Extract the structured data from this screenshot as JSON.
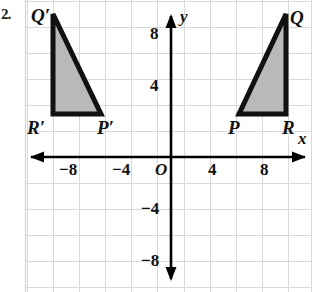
{
  "question_number": "2.",
  "figure": {
    "type": "coordinate-plane-with-triangles",
    "background_color": "#ffffff",
    "grid_color": "#d8d8d8",
    "axis_color": "#000000",
    "shape_fill_color": "#b8b8b8",
    "shape_stroke_color": "#000000",
    "axes": {
      "x_label": "x",
      "y_label": "y",
      "origin_label": "O",
      "x_ticks": [
        "−8",
        "−4",
        "4",
        "8"
      ],
      "y_ticks": [
        "8",
        "4",
        "−4",
        "−8"
      ],
      "x_range": [
        -10,
        10
      ],
      "y_range": [
        -10,
        11
      ],
      "grid_step": 2,
      "arrows": "both-ends-on-both-axes"
    },
    "shapes": [
      {
        "name": "triangle-image",
        "vertices": [
          {
            "label": "Q′",
            "x": -9,
            "y": 11
          },
          {
            "label": "P′",
            "x": -5.5,
            "y": 3.5
          },
          {
            "label": "R′",
            "x": -9,
            "y": 3.5
          }
        ]
      },
      {
        "name": "triangle-preimage",
        "vertices": [
          {
            "label": "Q",
            "x": 8.8,
            "y": 11
          },
          {
            "label": "P",
            "x": 5.3,
            "y": 3.5
          },
          {
            "label": "R",
            "x": 8.8,
            "y": 3.5
          }
        ]
      }
    ],
    "vertex_labels": {
      "q_prime": "Q′",
      "r_prime": "R′",
      "p_prime": "P′",
      "p": "P",
      "r": "R",
      "q": "Q"
    }
  }
}
